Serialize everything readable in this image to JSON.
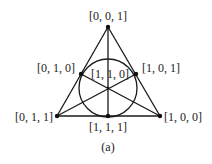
{
  "diagram": {
    "type": "fano-plane",
    "caption": "(a)",
    "colors": {
      "stroke": "#1a1a1a",
      "background": "#ffffff",
      "text": "#222222"
    },
    "points": [
      {
        "id": "top",
        "label": "[0, 0, 1]",
        "x": 108,
        "y": 27
      },
      {
        "id": "left-mid",
        "label": "[0, 1, 0]",
        "x": 81,
        "y": 74
      },
      {
        "id": "right-mid",
        "label": "[1, 0, 1]",
        "x": 136,
        "y": 74
      },
      {
        "id": "center",
        "label": "[1, 1, 0]",
        "x": 108,
        "y": 88
      },
      {
        "id": "bottom-left",
        "label": "[0, 1, 1]",
        "x": 57,
        "y": 116
      },
      {
        "id": "bottom-mid",
        "label": "[1, 1, 1]",
        "x": 108,
        "y": 116
      },
      {
        "id": "bottom-right",
        "label": "[1, 0, 0]",
        "x": 160,
        "y": 116
      }
    ],
    "lines": [
      [
        "top",
        "bottom-left"
      ],
      [
        "top",
        "bottom-right"
      ],
      [
        "bottom-left",
        "bottom-right"
      ],
      [
        "top",
        "bottom-mid"
      ],
      [
        "left-mid",
        "bottom-right"
      ],
      [
        "right-mid",
        "bottom-left"
      ]
    ],
    "circle": {
      "cx": 108,
      "cy": 88,
      "r": 29
    }
  }
}
